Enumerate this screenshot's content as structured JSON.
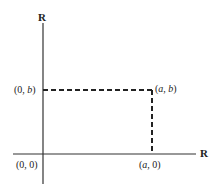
{
  "diagram": {
    "type": "coordinate-plane",
    "axes": {
      "x_label": "R",
      "y_label": "R"
    },
    "points": [
      {
        "id": "origin",
        "label": "(0, 0)"
      },
      {
        "id": "x-intercept",
        "label": "(a, 0)",
        "parts": [
          "(",
          "a",
          ", 0)"
        ]
      },
      {
        "id": "y-intercept",
        "label": "(0, b)",
        "parts": [
          "(0, ",
          "b",
          ")"
        ]
      },
      {
        "id": "point-ab",
        "label": "(a, b)",
        "parts": [
          "(",
          "a",
          ", ",
          "b",
          ")"
        ]
      }
    ],
    "dashed_lines": [
      {
        "from": "(0, b)",
        "to": "(a, b)"
      },
      {
        "from": "(a, b)",
        "to": "(a, 0)"
      }
    ]
  }
}
